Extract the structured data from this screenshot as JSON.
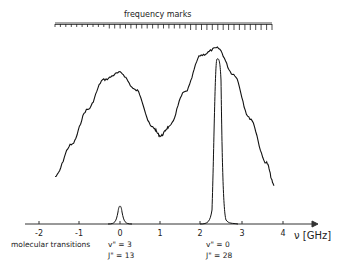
{
  "figure": {
    "freq_marks_label": "frequency marks",
    "axis_label": "ν [GHz]",
    "annotation_left": "molecular transitions",
    "transition_1": {
      "v": "v\" = 3",
      "j": "J\" = 13"
    },
    "transition_2": {
      "v": "v\" = 0",
      "j": "J\" = 28"
    },
    "ticks": [
      "-2",
      "-1",
      "0",
      "1",
      "2",
      "3",
      "4"
    ]
  },
  "chart_data": {
    "type": "line",
    "title": "",
    "xlabel": "ν [GHz]",
    "ylabel": "",
    "xlim": [
      -2.3,
      4.3
    ],
    "xticks": [
      -2,
      -1,
      0,
      1,
      2,
      3,
      4
    ],
    "grid": false,
    "series": [
      {
        "name": "broad fluorescence spectrum (noisy)",
        "x": [
          -1.6,
          -1.2,
          -0.8,
          -0.4,
          0.0,
          0.4,
          0.8,
          1.0,
          1.2,
          1.6,
          2.0,
          2.4,
          2.8,
          3.2,
          3.6,
          3.8
        ],
        "y": [
          0.27,
          0.45,
          0.65,
          0.82,
          0.86,
          0.76,
          0.55,
          0.5,
          0.55,
          0.75,
          0.96,
          1.0,
          0.85,
          0.6,
          0.35,
          0.22
        ]
      },
      {
        "name": "molecular transitions (narrow lines)",
        "x": [
          -0.3,
          -0.05,
          0.0,
          0.05,
          0.3,
          2.0,
          2.35,
          2.4,
          2.45,
          2.8
        ],
        "y": [
          0.0,
          0.05,
          0.18,
          0.05,
          0.0,
          0.0,
          0.6,
          0.95,
          0.6,
          0.0
        ]
      }
    ],
    "annotations": [
      {
        "x": 0.0,
        "text": "v\" = 3, J\" = 13"
      },
      {
        "x": 2.4,
        "text": "v\" = 0, J\" = 28"
      },
      {
        "text": "frequency marks",
        "position": "top"
      },
      {
        "text": "molecular transitions",
        "position": "below axis left"
      }
    ]
  }
}
